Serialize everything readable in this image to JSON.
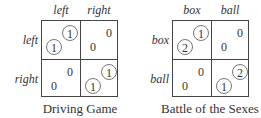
{
  "games": [
    {
      "title": "Driving Game",
      "column_labels": [
        "left",
        "right"
      ],
      "row_labels": [
        "left",
        "right"
      ],
      "cells": [
        [
          {
            "row_payoff": "1",
            "col_payoff": "1",
            "equilibrium": true
          },
          {
            "row_payoff": "0",
            "col_payoff": "0",
            "equilibrium": false
          }
        ],
        [
          {
            "row_payoff": "0",
            "col_payoff": "0",
            "equilibrium": false
          },
          {
            "row_payoff": "1",
            "col_payoff": "1",
            "equilibrium": true
          }
        ]
      ]
    },
    {
      "title": "Battle of the Sexes",
      "column_labels": [
        "box",
        "ball"
      ],
      "row_labels": [
        "box",
        "ball"
      ],
      "cells": [
        [
          {
            "row_payoff": "2",
            "col_payoff": "1",
            "equilibrium": true
          },
          {
            "row_payoff": "0",
            "col_payoff": "0",
            "equilibrium": false
          }
        ],
        [
          {
            "row_payoff": "0",
            "col_payoff": "0",
            "equilibrium": false
          },
          {
            "row_payoff": "1",
            "col_payoff": "2",
            "equilibrium": true
          }
        ]
      ]
    }
  ]
}
